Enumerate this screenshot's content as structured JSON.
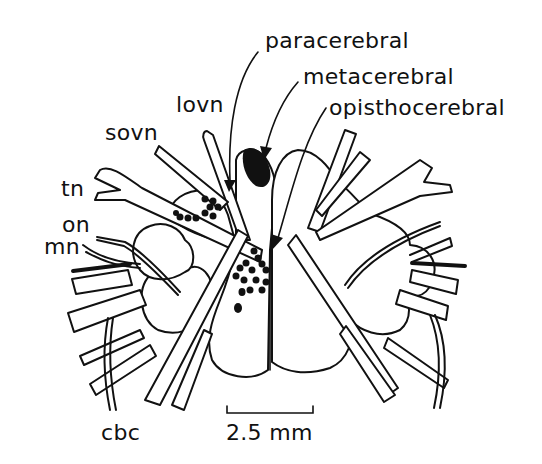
{
  "figure": {
    "labels": {
      "paracerebral": "paracerebral",
      "metacerebral": "metacerebral",
      "opisthocerebral": "opisthocerebral",
      "lovn": "lovn",
      "sovn": "sovn",
      "tn": "tn",
      "on": "on",
      "mn": "mn",
      "cbc": "cbc"
    },
    "scale_bar": {
      "label": "2.5 mm"
    },
    "colors": {
      "ink": "#111111",
      "background": "#ffffff"
    }
  }
}
